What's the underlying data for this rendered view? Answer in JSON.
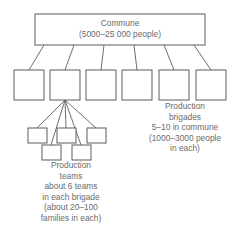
{
  "diagram": {
    "type": "hierarchy-org-chart",
    "colors": {
      "text": "#6b6b6b",
      "stroke": "#5d5d5d",
      "background": "#ffffff"
    },
    "commune": {
      "name": "commune-box",
      "line1": "Commune",
      "line2": "(5000–25 000 people)"
    },
    "brigades": {
      "count": 6,
      "boxes": [
        {
          "name": "brigade-box-1"
        },
        {
          "name": "brigade-box-2"
        },
        {
          "name": "brigade-box-3"
        },
        {
          "name": "brigade-box-4"
        },
        {
          "name": "brigade-box-5"
        },
        {
          "name": "brigade-box-6"
        }
      ],
      "caption": {
        "line1": "Production",
        "line2": "brigades",
        "line3": "5–10 in commune",
        "line4": "(1000–3000 people",
        "line5": "in each)"
      }
    },
    "teams": {
      "count": 5,
      "boxes": [
        {
          "name": "team-box-1"
        },
        {
          "name": "team-box-2"
        },
        {
          "name": "team-box-3"
        },
        {
          "name": "team-box-4"
        },
        {
          "name": "team-box-5"
        }
      ],
      "caption": {
        "line1": "Production",
        "line2": "teams",
        "line3": "about 6 teams",
        "line4": "in each brigade",
        "line5": "(about 20–100",
        "line6": "families in each)"
      }
    }
  }
}
